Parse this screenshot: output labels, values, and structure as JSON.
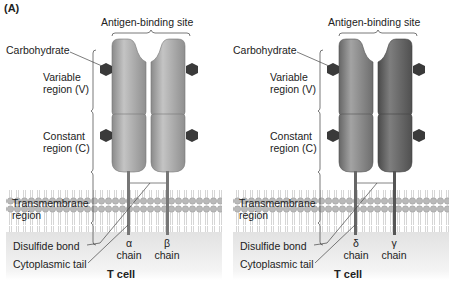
{
  "figure": {
    "panel_label": "(A)",
    "colors": {
      "chain_light": "#a9a9a9",
      "chain_dark_left": "#8e8e8e",
      "chain_dark_right": "#6e6e6e",
      "carbohydrate": "#3a3a3a",
      "membrane_head": "#bdbdbd",
      "cytoplasm": "#e6e6e6"
    }
  },
  "panels": [
    {
      "id": "alpha-beta",
      "antigen_binding_site": "Antigen-binding site",
      "carbohydrate": "Carbohydrate",
      "variable_region": [
        "Variable",
        "region (V)"
      ],
      "constant_region": [
        "Constant",
        "region (C)"
      ],
      "transmembrane_region": [
        "Transmembrane",
        "region"
      ],
      "disulfide_bond": "Disulfide bond",
      "cytoplasmic_tail": "Cytoplasmic tail",
      "chains": [
        {
          "symbol": "α",
          "label": "chain"
        },
        {
          "symbol": "β",
          "label": "chain"
        }
      ],
      "cell_label": "T cell"
    },
    {
      "id": "delta-gamma",
      "antigen_binding_site": "Antigen-binding site",
      "carbohydrate": "Carbohydrate",
      "variable_region": [
        "Variable",
        "region (V)"
      ],
      "constant_region": [
        "Constant",
        "region (C)"
      ],
      "transmembrane_region": [
        "Transmembrane",
        "region"
      ],
      "disulfide_bond": "Disulfide bond",
      "cytoplasmic_tail": "Cytoplasmic tail",
      "chains": [
        {
          "symbol": "δ",
          "label": "chain"
        },
        {
          "symbol": "γ",
          "label": "chain"
        }
      ],
      "cell_label": "T cell"
    }
  ]
}
